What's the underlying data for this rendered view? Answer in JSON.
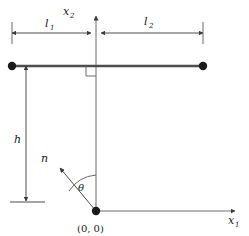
{
  "figure": {
    "background_color": "#ffffff",
    "line_color": "#4d4d4d",
    "beam_color": "#4d4d4d",
    "text_color": "#1a1a1a",
    "width": 249,
    "height": 236
  },
  "axes": {
    "x1": {
      "label": "x",
      "subscript": "1",
      "direction": "right",
      "origin_x": 96,
      "origin_y": 211,
      "tip_x": 237,
      "tip_y": 211
    },
    "x2": {
      "label": "x",
      "subscript": "2",
      "direction": "up",
      "origin_x": 96,
      "origin_y": 211,
      "tip_x": 96,
      "tip_y": 14
    }
  },
  "origin": {
    "label": "(0, 0)",
    "x": 96,
    "y": 211
  },
  "beam": {
    "left_x": 12,
    "right_x": 203,
    "y": 66,
    "left_node": {
      "x": 12,
      "y": 66
    },
    "right_node": {
      "x": 203,
      "y": 66
    }
  },
  "dimensions": {
    "l1": {
      "label": "l",
      "subscript": "1",
      "start_x": 12,
      "end_x": 91,
      "y": 33,
      "text_x": 47,
      "text_y": 26
    },
    "l2": {
      "label": "l",
      "subscript": "2",
      "start_x": 101,
      "end_x": 203,
      "y": 33,
      "text_x": 146,
      "text_y": 24
    },
    "h": {
      "label": "h",
      "x": 26,
      "top_y": 66,
      "bottom_y": 202,
      "text_x": 17,
      "text_y": 139
    }
  },
  "right_angle_marker": {
    "name": "right-angle-square",
    "x": 80,
    "y": 66,
    "size": 10
  },
  "normal_vector": {
    "label": "n",
    "tail_x": 96,
    "tail_y": 211,
    "tip_x": 58,
    "tip_y": 166,
    "text_x": 44,
    "text_y": 160
  },
  "angle": {
    "label": "θ",
    "text_x": 82,
    "text_y": 188,
    "vertex_x": 96,
    "vertex_y": 211,
    "radius": 36,
    "from": "x2-axis",
    "to": "normal-vector"
  }
}
